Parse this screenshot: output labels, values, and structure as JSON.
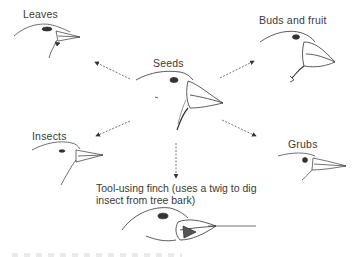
{
  "diagram": {
    "center": {
      "label": "Seeds"
    },
    "branches": [
      {
        "id": "leaves",
        "label": "Leaves"
      },
      {
        "id": "buds",
        "label": "Buds and fruit"
      },
      {
        "id": "insects",
        "label": "Insects"
      },
      {
        "id": "grubs",
        "label": "Grubs"
      },
      {
        "id": "tool",
        "label_line1": "Tool-using finch (uses a twig to dig",
        "label_line2": "insect from tree bark)"
      }
    ],
    "arrow_style": "dashed",
    "colors": {
      "ink": "#333333",
      "background": "#ffffff"
    }
  }
}
